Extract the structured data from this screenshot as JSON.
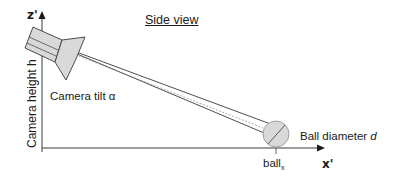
{
  "title": "Side view",
  "axes": {
    "z_label": "z'",
    "x_label": "x'"
  },
  "labels": {
    "camera_height": "Camera height h",
    "camera_tilt": "Camera tilt α",
    "ball_diameter_prefix": "Ball diameter ",
    "ball_diameter_symbol": "d",
    "ball_x_base": "ball",
    "ball_x_sub": "x"
  },
  "colors": {
    "line": "#3a3a3a",
    "fill": "#d9d9d9",
    "text": "#1a1a1a"
  }
}
